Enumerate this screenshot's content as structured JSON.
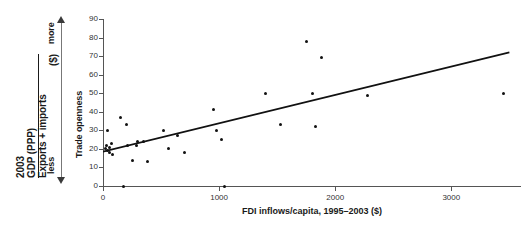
{
  "chart_data": {
    "type": "scatter",
    "title": "",
    "xlabel": "FDI inflows/capita, 1995–2003 ($)",
    "ylabel": "Trade openness",
    "xlim": [
      0,
      3600
    ],
    "ylim": [
      0,
      90
    ],
    "xticks": [
      0,
      1000,
      2000,
      3000
    ],
    "yticks": [
      0,
      10,
      20,
      30,
      40,
      50,
      60,
      70,
      80,
      90
    ],
    "grid": false,
    "legend": null,
    "annotations": {
      "y_axis_definition_numerator": "Exports + imports",
      "y_axis_definition_denominator": "GDP (PPP)",
      "y_axis_definition_year": "2003",
      "y_axis_definition_units": "($)",
      "direction_high": "more",
      "direction_low": "less"
    },
    "points": [
      {
        "x": 20,
        "y": 20
      },
      {
        "x": 30,
        "y": 22
      },
      {
        "x": 40,
        "y": 19
      },
      {
        "x": 55,
        "y": 21
      },
      {
        "x": 60,
        "y": 18
      },
      {
        "x": 75,
        "y": 23
      },
      {
        "x": 85,
        "y": 17
      },
      {
        "x": 40,
        "y": 30
      },
      {
        "x": 150,
        "y": 37
      },
      {
        "x": 175,
        "y": 0
      },
      {
        "x": 200,
        "y": 33
      },
      {
        "x": 210,
        "y": 22
      },
      {
        "x": 250,
        "y": 14
      },
      {
        "x": 290,
        "y": 22
      },
      {
        "x": 300,
        "y": 24
      },
      {
        "x": 350,
        "y": 24
      },
      {
        "x": 380,
        "y": 13
      },
      {
        "x": 520,
        "y": 30
      },
      {
        "x": 560,
        "y": 20
      },
      {
        "x": 640,
        "y": 27
      },
      {
        "x": 700,
        "y": 18
      },
      {
        "x": 950,
        "y": 41
      },
      {
        "x": 980,
        "y": 30
      },
      {
        "x": 1020,
        "y": 25
      },
      {
        "x": 1050,
        "y": 0
      },
      {
        "x": 1400,
        "y": 50
      },
      {
        "x": 1530,
        "y": 33
      },
      {
        "x": 1750,
        "y": 78
      },
      {
        "x": 1800,
        "y": 50
      },
      {
        "x": 1830,
        "y": 32
      },
      {
        "x": 1880,
        "y": 69
      },
      {
        "x": 2280,
        "y": 49
      },
      {
        "x": 3450,
        "y": 50
      }
    ],
    "trendline": {
      "type": "linear",
      "x_start": 0,
      "y_start": 18.5,
      "x_end": 3500,
      "y_end": 72
    }
  },
  "source_note": ""
}
